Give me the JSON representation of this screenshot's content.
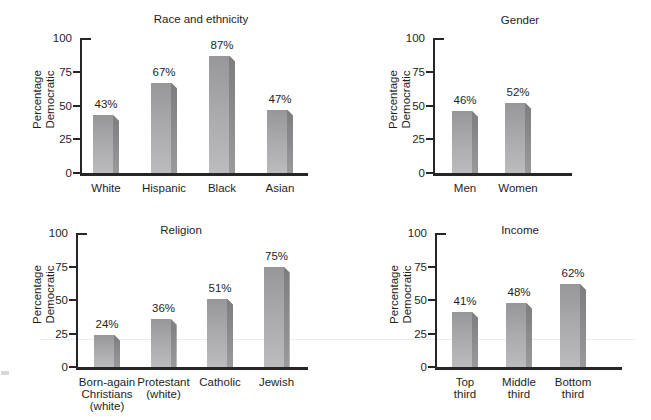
{
  "figure": {
    "ylabel": "Percentage Democratic",
    "unit": "%"
  },
  "palette": {
    "background": "#ffffff",
    "text": "#1e1e1e",
    "axis": "#262626",
    "bar_face_top": "#97979a",
    "bar_face_bottom": "#bcbcbe",
    "bar_side_face": "#7d7d80"
  },
  "chart_data": [
    {
      "id": "race-and-ethnicity",
      "type": "bar",
      "title": "Race and ethnicity",
      "ylabel": "Percentage Democratic",
      "ylabel_lines": [
        "Percentage",
        "Democratic"
      ],
      "ylim": [
        0,
        100
      ],
      "yticks": [
        0,
        25,
        50,
        75,
        100
      ],
      "grid": false,
      "legend": null,
      "categories": [
        "White",
        "Hispanic",
        "Black",
        "Asian"
      ],
      "category_lines": [
        [
          "White"
        ],
        [
          "Hispanic"
        ],
        [
          "Black"
        ],
        [
          "Asian"
        ]
      ],
      "values": [
        43,
        67,
        87,
        47
      ],
      "value_labels": [
        "43%",
        "67%",
        "87%",
        "47%"
      ]
    },
    {
      "id": "gender",
      "type": "bar",
      "title": "Gender",
      "ylabel": "Percentage Democratic",
      "ylabel_lines": [
        "Percentage",
        "Democratic"
      ],
      "ylim": [
        0,
        100
      ],
      "yticks": [
        0,
        25,
        50,
        75,
        100
      ],
      "grid": false,
      "legend": null,
      "categories": [
        "Men",
        "Women"
      ],
      "category_lines": [
        [
          "Men"
        ],
        [
          "Women"
        ]
      ],
      "values": [
        46,
        52
      ],
      "value_labels": [
        "46%",
        "52%"
      ]
    },
    {
      "id": "religion",
      "type": "bar",
      "title": "Religion",
      "ylabel": "Percentage Democratic",
      "ylabel_lines": [
        "Percentage",
        "Democratic"
      ],
      "ylim": [
        0,
        100
      ],
      "yticks": [
        0,
        25,
        50,
        75,
        100
      ],
      "grid": false,
      "legend": null,
      "categories": [
        "Born-again Christians (white)",
        "Protestant (white)",
        "Catholic",
        "Jewish"
      ],
      "category_lines": [
        [
          "Born-again",
          "Christians",
          "(white)"
        ],
        [
          "Protestant",
          "(white)"
        ],
        [
          "Catholic"
        ],
        [
          "Jewish"
        ]
      ],
      "values": [
        24,
        36,
        51,
        75
      ],
      "value_labels": [
        "24%",
        "36%",
        "51%",
        "75%"
      ]
    },
    {
      "id": "income",
      "type": "bar",
      "title": "Income",
      "ylabel": "Percentage Democratic",
      "ylabel_lines": [
        "Percentage",
        "Democratic"
      ],
      "ylim": [
        0,
        100
      ],
      "yticks": [
        0,
        25,
        50,
        75,
        100
      ],
      "grid": false,
      "legend": null,
      "categories": [
        "Top third",
        "Middle third",
        "Bottom third"
      ],
      "category_lines": [
        [
          "Top",
          "third"
        ],
        [
          "Middle",
          "third"
        ],
        [
          "Bottom",
          "third"
        ]
      ],
      "values": [
        41,
        48,
        62
      ],
      "value_labels": [
        "41%",
        "48%",
        "62%"
      ]
    }
  ]
}
